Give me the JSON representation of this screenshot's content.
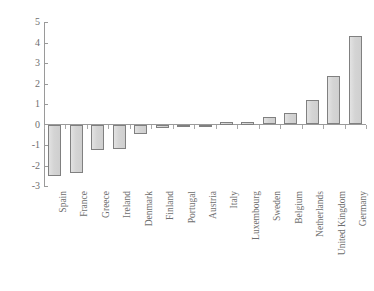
{
  "chart_data": {
    "type": "bar",
    "title": "",
    "subtitle": "",
    "xlabel": "",
    "ylabel": "",
    "ylim": [
      -3,
      5
    ],
    "yticks": [
      5,
      4,
      3,
      2,
      1,
      0,
      -1,
      -2,
      -3
    ],
    "ytick_labels": [
      "5",
      "4",
      "3",
      "2",
      "1",
      "0",
      "-1",
      "-2",
      "-3"
    ],
    "grid": false,
    "legend": null,
    "categories": [
      "Spain",
      "France",
      "Greece",
      "Ireland",
      "Denmark",
      "Finland",
      "Portugal",
      "Austria",
      "Italy",
      "Luxembourg",
      "Sweden",
      "Belgium",
      "Netherlands",
      "United Kingdom",
      "Germany"
    ],
    "values": [
      -2.5,
      -2.35,
      -1.25,
      -1.2,
      -0.45,
      -0.15,
      -0.1,
      -0.02,
      0.12,
      0.1,
      0.35,
      0.55,
      1.2,
      2.35,
      4.3
    ],
    "bar_fill_color": "#d6d6d6",
    "bar_edge_color": "#808080",
    "axis_color": "#9a9a9a",
    "text_color": "#6e6e6e",
    "background_color": "#ffffff"
  }
}
